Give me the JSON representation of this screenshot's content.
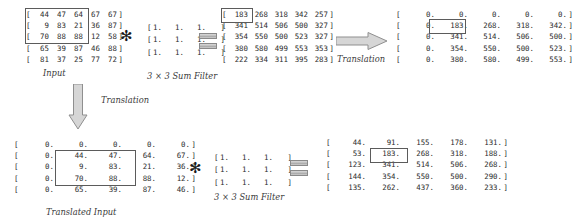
{
  "diagram": {
    "title_absent": true,
    "colors": {
      "text": "#2b2b2b",
      "highlight_border": "#5b5b5b",
      "arrow_fill": "#d0d0d0",
      "arrow_stroke": "#909090"
    },
    "labels": {
      "input": "Input",
      "sum_filter_top": "3 × 3 Sum Filter",
      "sum_filter_bottom": "3 × 3 Sum Filter",
      "translation_right": "Translation",
      "translation_down": "Translation",
      "translated_input": "Translated Input"
    },
    "operators": {
      "conv_top": "✻",
      "conv_bottom": "✻",
      "equals_top": "=",
      "equals_bottom": "="
    },
    "matrices": {
      "input": {
        "name": "Input",
        "format": "int",
        "rows": [
          [
            "44",
            "47",
            "64",
            "67",
            "67"
          ],
          [
            "9",
            "83",
            "21",
            "36",
            "87"
          ],
          [
            "70",
            "88",
            "88",
            "12",
            "58"
          ],
          [
            "65",
            "39",
            "87",
            "46",
            "88"
          ],
          [
            "81",
            "37",
            "25",
            "77",
            "72"
          ]
        ]
      },
      "sum_filter_top": {
        "name": "3 × 3 Sum Filter",
        "format": "float",
        "rows": [
          [
            "1.",
            "1.",
            "1."
          ],
          [
            "1.",
            "1.",
            "1."
          ],
          [
            "1.",
            "1.",
            "1."
          ]
        ]
      },
      "conv_result_top": {
        "name": "Convolution result",
        "format": "int",
        "rows": [
          [
            "183",
            "268",
            "318",
            "342",
            "257"
          ],
          [
            "341",
            "514",
            "506",
            "500",
            "327"
          ],
          [
            "354",
            "550",
            "500",
            "523",
            "327"
          ],
          [
            "380",
            "580",
            "499",
            "553",
            "353"
          ],
          [
            "222",
            "334",
            "311",
            "395",
            "283"
          ]
        ]
      },
      "translated_result_top": {
        "name": "Translated convolution result",
        "format": "float",
        "rows": [
          [
            "0.",
            "0.",
            "0.",
            "0.",
            "0."
          ],
          [
            "0.",
            "183.",
            "268.",
            "318.",
            "342."
          ],
          [
            "0.",
            "341.",
            "514.",
            "506.",
            "500."
          ],
          [
            "0.",
            "354.",
            "550.",
            "500.",
            "523."
          ],
          [
            "0.",
            "380.",
            "580.",
            "499.",
            "553."
          ]
        ]
      },
      "translated_input": {
        "name": "Translated Input",
        "format": "float",
        "rows": [
          [
            "0.",
            "0.",
            "0.",
            "0.",
            "0."
          ],
          [
            "0.",
            "44.",
            "47.",
            "64.",
            "67."
          ],
          [
            "0.",
            "9.",
            "83.",
            "21.",
            "36."
          ],
          [
            "0.",
            "70.",
            "88.",
            "88.",
            "12."
          ],
          [
            "0.",
            "65.",
            "39.",
            "87.",
            "46."
          ]
        ]
      },
      "sum_filter_bottom": {
        "name": "3 × 3 Sum Filter",
        "format": "float",
        "rows": [
          [
            "1.",
            "1.",
            "1."
          ],
          [
            "1.",
            "1.",
            "1."
          ],
          [
            "1.",
            "1.",
            "1."
          ]
        ]
      },
      "conv_result_bottom": {
        "name": "Convolution of translated input",
        "format": "float",
        "rows": [
          [
            "44.",
            "91.",
            "155.",
            "178.",
            "131."
          ],
          [
            "53.",
            "183.",
            "268.",
            "318.",
            "188."
          ],
          [
            "123.",
            "341.",
            "514.",
            "506.",
            "268."
          ],
          [
            "144.",
            "354.",
            "550.",
            "500.",
            "290."
          ],
          [
            "135.",
            "262.",
            "437.",
            "360.",
            "233."
          ]
        ]
      }
    }
  }
}
